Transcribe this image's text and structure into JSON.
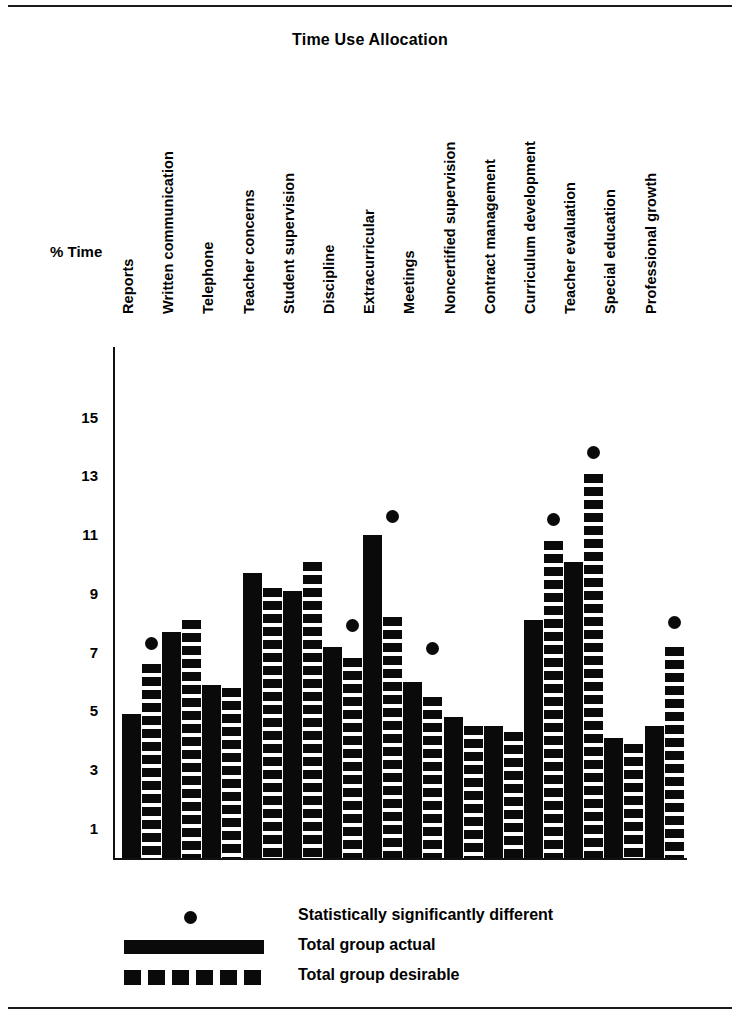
{
  "figure": {
    "title": "Time Use Allocation",
    "y_axis_label": "% Time"
  },
  "legend": {
    "position": "bottom-left",
    "items": [
      {
        "key": "dot",
        "label": "Statistically significantly different"
      },
      {
        "key": "solid",
        "label": "Total group actual"
      },
      {
        "key": "dash",
        "label": "Total group desirable"
      }
    ]
  },
  "chart_data": {
    "type": "bar",
    "title": "Time Use Allocation",
    "xlabel": "",
    "ylabel": "% Time",
    "ylim": [
      0,
      15
    ],
    "yticks": [
      15,
      13,
      11,
      9,
      7,
      5,
      3,
      1
    ],
    "grid": false,
    "legend_position": "bottom-left",
    "categories": [
      "Reports",
      "Written communication",
      "Telephone",
      "Teacher concerns",
      "Student supervision",
      "Discipline",
      "Extracurricular",
      "Meetings",
      "Noncertified supervision",
      "Contract management",
      "Curriculum development",
      "Teacher evaluation",
      "Special education",
      "Professional growth"
    ],
    "series": [
      {
        "name": "Total group actual",
        "values": [
          4.9,
          7.7,
          5.9,
          9.7,
          9.1,
          7.2,
          11.0,
          6.0,
          4.8,
          4.5,
          8.1,
          10.1,
          4.1,
          4.5
        ]
      },
      {
        "name": "Total group desirable",
        "values": [
          6.6,
          8.1,
          5.8,
          9.2,
          10.1,
          6.8,
          8.2,
          5.5,
          4.5,
          4.3,
          10.8,
          13.1,
          3.9,
          7.2
        ]
      }
    ],
    "significance_markers": {
      "name": "Statistically significantly different",
      "categories": [
        "Reports",
        "Discipline",
        "Extracurricular",
        "Meetings",
        "Curriculum development",
        "Teacher evaluation",
        "Professional growth"
      ],
      "values": [
        7.1,
        7.7,
        11.4,
        6.9,
        11.3,
        13.6,
        7.8
      ]
    }
  }
}
